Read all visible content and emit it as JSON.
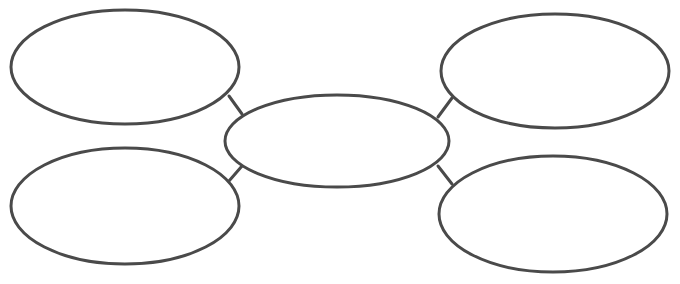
{
  "diagram": {
    "type": "bubble-map",
    "stroke_color": "#4a4a4a",
    "background_color": "#ffffff",
    "center": {
      "label": ""
    },
    "nodes": [
      {
        "position": "top-left",
        "label": ""
      },
      {
        "position": "top-right",
        "label": ""
      },
      {
        "position": "bottom-left",
        "label": ""
      },
      {
        "position": "bottom-right",
        "label": ""
      }
    ],
    "connections": [
      {
        "from": "top-left",
        "to": "center"
      },
      {
        "from": "top-right",
        "to": "center"
      },
      {
        "from": "bottom-left",
        "to": "center"
      },
      {
        "from": "bottom-right",
        "to": "center"
      }
    ]
  }
}
